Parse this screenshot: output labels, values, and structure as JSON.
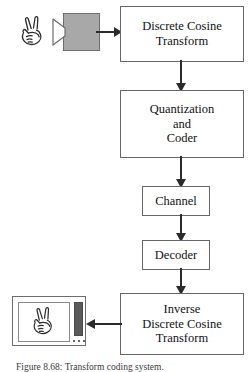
{
  "figure": {
    "caption": "Figure 8.68: Transform coding system."
  },
  "source": {
    "hand_icon": "hand-v-sign-icon",
    "camera": {
      "icon": "video-camera-icon",
      "body_color": "#a8a8a8",
      "border_color": "#6d6d6d"
    }
  },
  "blocks": [
    {
      "id": "dct",
      "name": "discrete-cosine-transform-block",
      "lines": [
        "Discrete Cosine",
        "Transform"
      ]
    },
    {
      "id": "quant",
      "name": "quantization-and-coder-block",
      "lines": [
        "Quantization",
        "and",
        "Coder"
      ]
    },
    {
      "id": "channel",
      "name": "channel-block",
      "lines": [
        "Channel"
      ]
    },
    {
      "id": "decoder",
      "name": "decoder-block",
      "lines": [
        "Decoder"
      ]
    },
    {
      "id": "idct",
      "name": "inverse-discrete-cosine-transform-block",
      "lines": [
        "Inverse",
        "Discrete Cosine",
        "Transform"
      ]
    }
  ],
  "arrows": [
    {
      "id": "cam-dct",
      "from": "camera",
      "to": "dct",
      "direction": "right"
    },
    {
      "id": "dct-q",
      "from": "dct",
      "to": "quant",
      "direction": "down"
    },
    {
      "id": "q-ch",
      "from": "quant",
      "to": "channel",
      "direction": "down"
    },
    {
      "id": "ch-dec",
      "from": "channel",
      "to": "decoder",
      "direction": "down"
    },
    {
      "id": "dec-idct",
      "from": "decoder",
      "to": "idct",
      "direction": "down"
    },
    {
      "id": "idct-mon",
      "from": "idct",
      "to": "monitor",
      "direction": "left"
    }
  ],
  "display": {
    "name": "reconstructed-image-display",
    "hand_icon": "hand-v-sign-icon",
    "bar_color": "#5a5a5a",
    "dots": 3
  },
  "colors": {
    "box_border": "#666666",
    "arrow": "#2b2b2b",
    "text": "#111111",
    "camera_gray": "#a8a8a8",
    "bar_gray": "#5a5a5a"
  }
}
